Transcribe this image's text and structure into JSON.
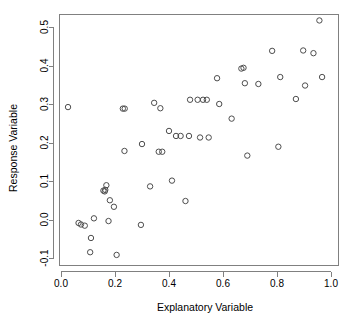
{
  "chart_data": {
    "type": "scatter",
    "title": "",
    "xlabel": "Explanatory Variable",
    "ylabel": "Response Variable",
    "xlim": [
      -0.01,
      1.01
    ],
    "ylim": [
      -0.115,
      0.53
    ],
    "grid": false,
    "legend": null,
    "marker": "open-circle",
    "marker_color": "#4d4d4d",
    "xticks": [
      "0.0",
      "0.2",
      "0.4",
      "0.6",
      "0.8",
      "1.0"
    ],
    "xtick_values": [
      0.0,
      0.2,
      0.4,
      0.6,
      0.8,
      1.0
    ],
    "yticks": [
      "-0.1",
      "0.0",
      "0.1",
      "0.2",
      "0.3",
      "0.4",
      "0.5"
    ],
    "ytick_values": [
      -0.1,
      0.0,
      0.1,
      0.2,
      0.3,
      0.4,
      0.5
    ],
    "n_points": 52,
    "x": [
      0.026,
      0.065,
      0.074,
      0.088,
      0.108,
      0.111,
      0.122,
      0.157,
      0.162,
      0.164,
      0.168,
      0.176,
      0.181,
      0.196,
      0.206,
      0.229,
      0.235,
      0.236,
      0.296,
      0.3,
      0.33,
      0.345,
      0.362,
      0.368,
      0.375,
      0.4,
      0.411,
      0.426,
      0.443,
      0.461,
      0.474,
      0.478,
      0.506,
      0.515,
      0.526,
      0.54,
      0.547,
      0.578,
      0.586,
      0.632,
      0.668,
      0.676,
      0.681,
      0.69,
      0.731,
      0.782,
      0.805,
      0.812,
      0.87,
      0.897,
      0.904,
      0.935,
      0.957,
      0.967
    ],
    "y": [
      0.292,
      -0.009,
      -0.013,
      -0.016,
      -0.085,
      -0.048,
      0.003,
      0.075,
      0.073,
      0.077,
      0.089,
      -0.004,
      0.05,
      0.033,
      -0.092,
      0.288,
      0.178,
      0.288,
      -0.014,
      0.196,
      0.086,
      0.303,
      0.176,
      0.289,
      0.176,
      0.23,
      0.101,
      0.217,
      0.217,
      0.048,
      0.217,
      0.311,
      0.311,
      0.213,
      0.311,
      0.311,
      0.213,
      0.367,
      0.3,
      0.262,
      0.392,
      0.394,
      0.354,
      0.166,
      0.352,
      0.438,
      0.189,
      0.37,
      0.313,
      0.439,
      0.348,
      0.432,
      0.517,
      0.37
    ]
  },
  "axes": {
    "x_title": "Explanatory Variable",
    "y_title": "Response Variable"
  }
}
